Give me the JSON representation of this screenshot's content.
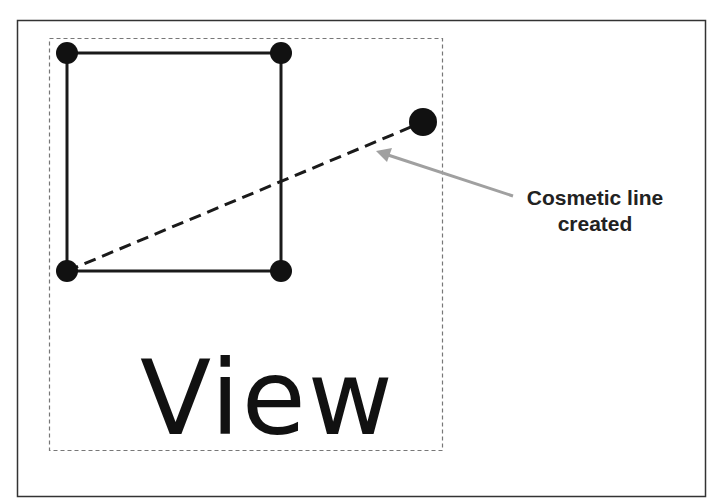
{
  "diagram": {
    "view_label": "View",
    "callout": {
      "line1": "Cosmetic line",
      "line2": "created"
    },
    "colors": {
      "stroke": "#1a1a1a",
      "arrow": "#a0a0a0",
      "frame": "#333333",
      "view_border": "#777777"
    }
  }
}
